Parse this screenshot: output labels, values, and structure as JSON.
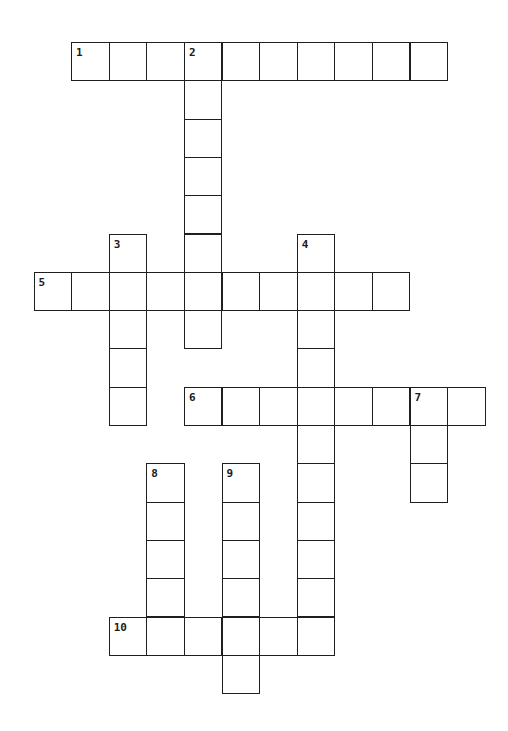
{
  "puzzle": {
    "type": "crossword",
    "cell_size": {
      "w": 37.6,
      "h": 38.3
    },
    "origin": {
      "x": 33.5,
      "y": 42
    },
    "entries": [
      {
        "number": "1",
        "direction": "across",
        "row": 0,
        "col": 1,
        "length": 10
      },
      {
        "number": "2",
        "direction": "down",
        "row": 0,
        "col": 4,
        "length": 8
      },
      {
        "number": "3",
        "direction": "down",
        "row": 5,
        "col": 2,
        "length": 5
      },
      {
        "number": "4",
        "direction": "down",
        "row": 5,
        "col": 7,
        "length": 11
      },
      {
        "number": "5",
        "direction": "across",
        "row": 6,
        "col": 0,
        "length": 10
      },
      {
        "number": "6",
        "direction": "across",
        "row": 9,
        "col": 4,
        "length": 8
      },
      {
        "number": "7",
        "direction": "down",
        "row": 9,
        "col": 10,
        "length": 3
      },
      {
        "number": "8",
        "direction": "down",
        "row": 11,
        "col": 3,
        "length": 5
      },
      {
        "number": "9",
        "direction": "down",
        "row": 11,
        "col": 5,
        "length": 6
      },
      {
        "number": "10",
        "direction": "across",
        "row": 15,
        "col": 2,
        "length": 6
      }
    ]
  }
}
